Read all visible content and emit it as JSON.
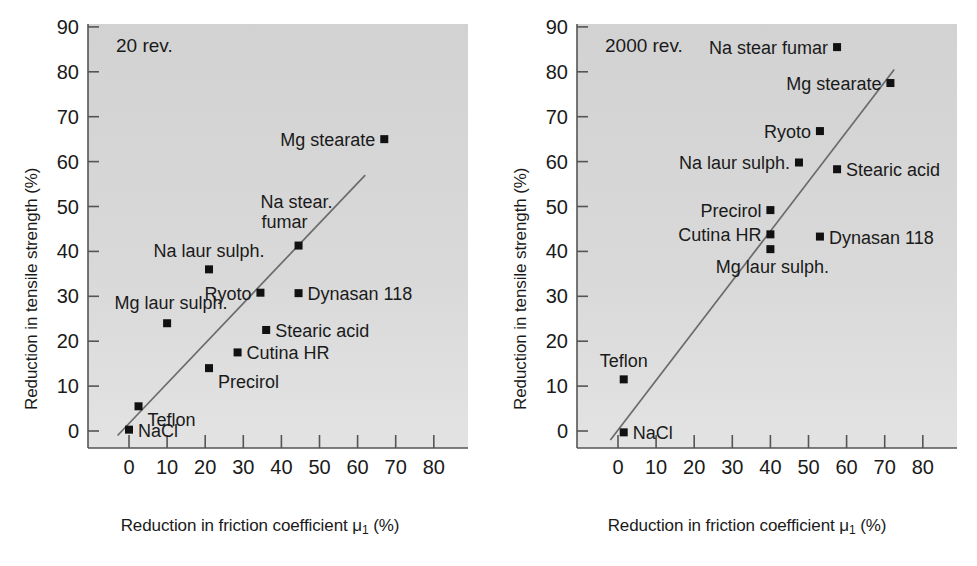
{
  "figure": {
    "axis_label_x": "Reduction in friction coefficient",
    "axis_label_x_symbol": "μ",
    "axis_label_x_symbol_sub": "1",
    "axis_label_x_unit": "(%)",
    "axis_label_y": "Reduction in tensile strength (%)",
    "colors": {
      "plot_background": "#d7d7d7",
      "axis": "#555555",
      "marker": "#111111",
      "trendline": "#6b6b6b",
      "text": "#1a1a1a",
      "page_background": "#ffffff"
    }
  },
  "chart_data": [
    {
      "type": "scatter",
      "title": "20 rev.",
      "panel": "left",
      "xlabel": "Reduction in friction coefficient μ₁ (%)",
      "ylabel": "Reduction in tensile strength (%)",
      "xlim": [
        -5,
        80
      ],
      "ylim": [
        -8,
        90
      ],
      "xticks": [
        0,
        10,
        20,
        30,
        40,
        50,
        60,
        70,
        80
      ],
      "yticks": [
        0,
        10,
        20,
        30,
        40,
        50,
        60,
        70,
        80,
        90
      ],
      "grid": false,
      "legend": "none",
      "points": [
        {
          "label": "NaCl",
          "x": 0.0,
          "y": 0.3,
          "label_pos": "right"
        },
        {
          "label": "Teflon",
          "x": 2.5,
          "y": 5.5,
          "label_pos": "right-below"
        },
        {
          "label": "Precirol",
          "x": 21.0,
          "y": 14.0,
          "label_pos": "right-below"
        },
        {
          "label": "Cutina HR",
          "x": 28.5,
          "y": 17.5,
          "label_pos": "right"
        },
        {
          "label": "Stearic acid",
          "x": 36.0,
          "y": 22.5,
          "label_pos": "right"
        },
        {
          "label": "Mg laur sulph.",
          "x": 10.0,
          "y": 24.0,
          "label_pos": "above-left"
        },
        {
          "label": "Ryoto",
          "x": 34.5,
          "y": 30.8,
          "label_pos": "left"
        },
        {
          "label": "Dynasan 118",
          "x": 44.5,
          "y": 30.7,
          "label_pos": "right"
        },
        {
          "label": "Na laur sulph.",
          "x": 21.0,
          "y": 36.0,
          "label_pos": "above"
        },
        {
          "label": "Na stear. fumar",
          "x": 44.5,
          "y": 41.3,
          "label_pos": "above-two-line"
        },
        {
          "label": "Mg stearate",
          "x": 67.0,
          "y": 65.0,
          "label_pos": "left"
        }
      ],
      "trendline": {
        "x1": -3.0,
        "y1": -1.0,
        "x2": 62.0,
        "y2": 57.0
      }
    },
    {
      "type": "scatter",
      "title": "2000 rev.",
      "panel": "right",
      "xlabel": "Reduction in friction coefficient μ₁ (%)",
      "ylabel": "Reduction in tensile strength (%)",
      "xlim": [
        -5,
        80
      ],
      "ylim": [
        -8,
        90
      ],
      "xticks": [
        0,
        10,
        20,
        30,
        40,
        50,
        60,
        70,
        80
      ],
      "yticks": [
        0,
        10,
        20,
        30,
        40,
        50,
        60,
        70,
        80,
        90
      ],
      "grid": false,
      "legend": "none",
      "points": [
        {
          "label": "NaCl",
          "x": 1.5,
          "y": -0.3,
          "label_pos": "right"
        },
        {
          "label": "Teflon",
          "x": 1.5,
          "y": 11.5,
          "label_pos": "above"
        },
        {
          "label": "Mg laur sulph.",
          "x": 40.0,
          "y": 40.5,
          "label_pos": "below-right"
        },
        {
          "label": "Cutina HR",
          "x": 40.0,
          "y": 43.8,
          "label_pos": "left"
        },
        {
          "label": "Dynasan 118",
          "x": 53.0,
          "y": 43.3,
          "label_pos": "right"
        },
        {
          "label": "Precirol",
          "x": 40.0,
          "y": 49.2,
          "label_pos": "left"
        },
        {
          "label": "Stearic acid",
          "x": 57.5,
          "y": 58.3,
          "label_pos": "right"
        },
        {
          "label": "Na laur sulph.",
          "x": 47.5,
          "y": 59.8,
          "label_pos": "left"
        },
        {
          "label": "Ryoto",
          "x": 53.0,
          "y": 66.8,
          "label_pos": "left"
        },
        {
          "label": "Mg stearate",
          "x": 71.5,
          "y": 77.5,
          "label_pos": "left"
        },
        {
          "label": "Na stear fumar",
          "x": 57.5,
          "y": 85.5,
          "label_pos": "left"
        }
      ],
      "trendline": {
        "x1": -2.0,
        "y1": -2.0,
        "x2": 72.5,
        "y2": 80.5
      }
    }
  ]
}
